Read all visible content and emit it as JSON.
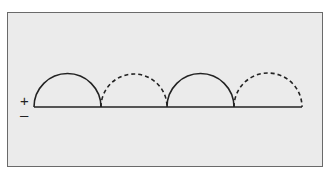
{
  "diagram": {
    "labels": {
      "plus": "+",
      "minus": "–"
    },
    "baseline": {
      "x1": 34,
      "x2": 302,
      "y": 107
    },
    "arcs": [
      {
        "x1": 34,
        "x2": 101,
        "style": "solid"
      },
      {
        "x1": 101,
        "x2": 167,
        "style": "dashed"
      },
      {
        "x1": 167,
        "x2": 234,
        "style": "solid"
      },
      {
        "x1": 234,
        "x2": 302,
        "style": "dashed"
      }
    ],
    "colors": {
      "background": "#ebebeb",
      "stroke": "#222222",
      "border": "#6a6a6a"
    }
  }
}
